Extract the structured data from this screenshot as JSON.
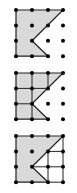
{
  "figures": [
    {
      "id": "figure-1",
      "description": "Shaded pentagon on 4x4 dot grid",
      "grid": {
        "cols": 4,
        "rows": 4
      },
      "shape": [
        [
          0,
          0
        ],
        [
          3,
          0
        ],
        [
          1,
          2
        ],
        [
          2,
          3
        ],
        [
          0,
          3
        ]
      ],
      "inner_lines": []
    },
    {
      "id": "figure-2",
      "description": "Shaded pentagon divided into unit squares/triangles",
      "grid": {
        "cols": 4,
        "rows": 4
      },
      "shape": [
        [
          0,
          0
        ],
        [
          3,
          0
        ],
        [
          1,
          2
        ],
        [
          2,
          3
        ],
        [
          0,
          3
        ]
      ],
      "inner_lines": [
        [
          [
            1,
            0
          ],
          [
            1,
            3
          ]
        ],
        [
          [
            2,
            0
          ],
          [
            2,
            1
          ]
        ],
        [
          [
            0,
            1
          ],
          [
            2,
            1
          ]
        ],
        [
          [
            0,
            2
          ],
          [
            1,
            2
          ]
        ]
      ]
    },
    {
      "id": "figure-3",
      "description": "Shaded pentagon with complement region divided by lines",
      "grid": {
        "cols": 4,
        "rows": 4
      },
      "shape": [
        [
          0,
          0
        ],
        [
          3,
          0
        ],
        [
          1,
          2
        ],
        [
          2,
          3
        ],
        [
          0,
          3
        ]
      ],
      "inner_lines": [
        [
          [
            2,
            1
          ],
          [
            3,
            1
          ]
        ],
        [
          [
            1,
            2
          ],
          [
            3,
            2
          ]
        ],
        [
          [
            2,
            1
          ],
          [
            2,
            3
          ]
        ],
        [
          [
            3,
            0
          ],
          [
            3,
            3
          ]
        ],
        [
          [
            2,
            3
          ],
          [
            3,
            3
          ]
        ]
      ]
    }
  ],
  "colors": {
    "fill": "#d9d9d9",
    "stroke": "#222222",
    "dot": "#000000"
  }
}
